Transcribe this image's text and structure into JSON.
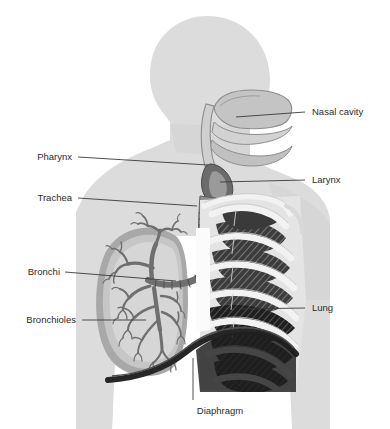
{
  "diagram": {
    "view": "lateral silhouette of head and thorax",
    "background_color": "#ffffff",
    "body_color": "#dcdcdc",
    "label_color": "#2b2b2b",
    "leader_color": "#3a3a3a",
    "palette": {
      "body_silhouette": "#dcdcdc",
      "body_shade": "#d2d2d2",
      "airway_light": "#e8e8e8",
      "airway_mid": "#b4b4b4",
      "airway_dark": "#6e6e6e",
      "lung_outer": "#a8a8a8",
      "lung_inner": "#c6c6c6",
      "lung_core": "#d8d8d8",
      "bronchi": "#6f6f6f",
      "rib_bone": "#efefef",
      "rib_shadow_dark": "#3a3a3a",
      "rib_shadow_black": "#1c1c1c",
      "diaphragm": "#262626",
      "trachea_ring": "#5f5f5f"
    },
    "labels": [
      {
        "id": "nasal-cavity",
        "text": "Nasal cavity",
        "side": "right",
        "text_x": 312,
        "text_y": 115,
        "leader": "M 236 117 L 305 112"
      },
      {
        "id": "pharynx",
        "text": "Pharynx",
        "side": "left",
        "text_x": 72,
        "text_y": 160,
        "leader": "M 78 157 L 208 165"
      },
      {
        "id": "larynx",
        "text": "Larynx",
        "side": "right",
        "text_x": 312,
        "text_y": 183,
        "leader": "M 218 181 L 305 180"
      },
      {
        "id": "trachea",
        "text": "Trachea",
        "side": "left",
        "text_x": 72,
        "text_y": 201,
        "leader": "M 78 198 L 196 204"
      },
      {
        "id": "bronchi",
        "text": "Bronchi",
        "side": "left",
        "text_x": 60,
        "text_y": 275,
        "leader": "M 65 272 L 175 279"
      },
      {
        "id": "lung",
        "text": "Lung",
        "side": "right",
        "text_x": 312,
        "text_y": 311,
        "leader": "M 239 309 L 305 308"
      },
      {
        "id": "bronchioles",
        "text": "Bronchioles",
        "side": "left",
        "text_x": 76,
        "text_y": 323,
        "leader": "M 82 320 L 148 320"
      },
      {
        "id": "diaphragm",
        "text": "Diaphragm",
        "side": "bottom",
        "text_x": 220,
        "text_y": 414,
        "leader": "M 193 360 L 193 400"
      }
    ],
    "structures": [
      "nasal cavity",
      "hard palate",
      "tongue",
      "pharynx",
      "epiglottis",
      "larynx",
      "trachea with cartilage rings",
      "primary bronchi",
      "bronchial tree",
      "bronchioles",
      "left lung",
      "rib cage",
      "clavicle",
      "sternum",
      "diaphragm"
    ]
  }
}
